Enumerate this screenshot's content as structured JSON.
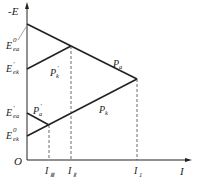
{
  "axes": {
    "y_label": "-E",
    "x_label": "I",
    "origin_label": "O"
  },
  "y_ticks": [
    {
      "main": "E",
      "sup": "0",
      "sub": "ea",
      "y": 24
    },
    {
      "main": "E",
      "sup": "'",
      "sub": "ek",
      "y": 69
    },
    {
      "main": "E",
      "sup": "'",
      "sub": "ea",
      "y": 113
    },
    {
      "main": "E",
      "sup": "0",
      "sub": "ek",
      "y": 136
    }
  ],
  "x_ticks": [
    {
      "main": "I",
      "sub": "Ⅲ",
      "x": 49
    },
    {
      "main": "I",
      "sub": "Ⅱ",
      "x": 71
    },
    {
      "main": "I",
      "sub": "1",
      "x": 137
    }
  ],
  "lines": [
    {
      "name": "P_a",
      "label_main": "P",
      "label_sub": "a"
    },
    {
      "name": "P_k",
      "label_main": "P",
      "label_sub": "k"
    },
    {
      "name": "P'_k",
      "label_main": "P",
      "label_sup": "'",
      "label_sub": "k"
    },
    {
      "name": "P'_a",
      "label_main": "P",
      "label_sup": "'",
      "label_sub": "a"
    }
  ]
}
